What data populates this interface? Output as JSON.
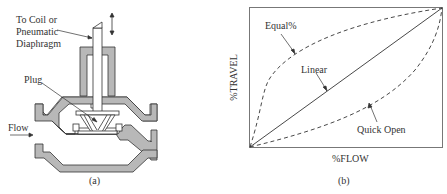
{
  "figure_a": {
    "caption": "(a)",
    "labels": {
      "actuator_line1": "To Coil or",
      "actuator_line2": "Pneumatic",
      "actuator_line3": "Diaphragm",
      "plug": "Plug",
      "flow": "Flow"
    }
  },
  "figure_b": {
    "caption": "(b)",
    "xlabel": "%FLOW",
    "ylabel": "%TRAVEL",
    "curves": {
      "equal": "Equal%",
      "linear": "Linear",
      "quick": "Quick Open"
    }
  },
  "colors": {
    "body_fill": "#b8b8b8",
    "stroke": "#333333"
  }
}
